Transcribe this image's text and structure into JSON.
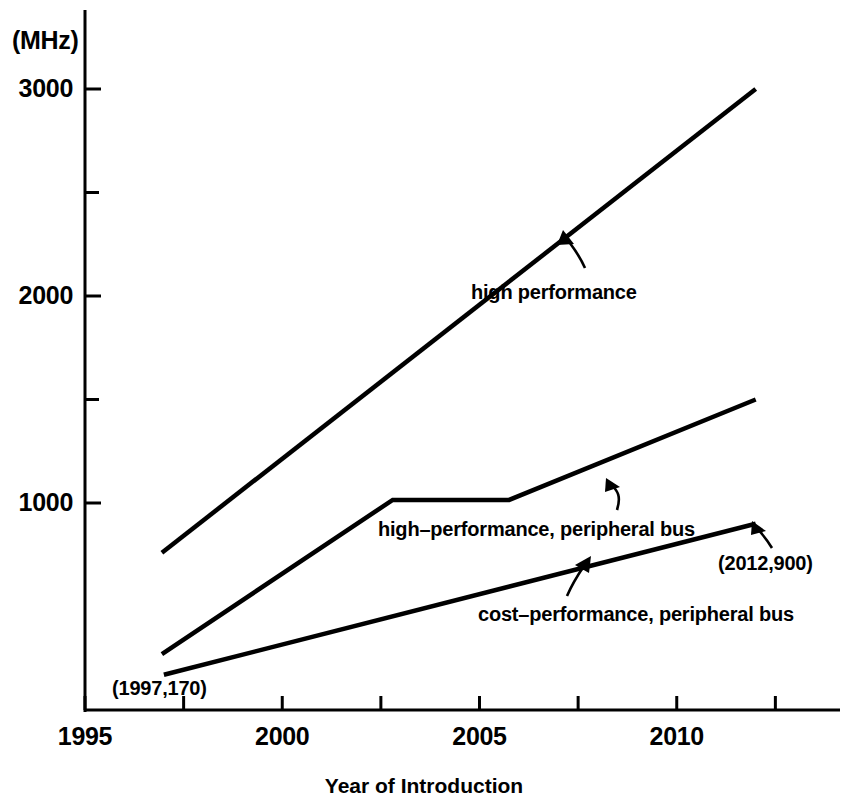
{
  "chart_data": {
    "type": "line",
    "title": "",
    "subtitle": "",
    "xlabel": "Year of Introduction",
    "ylabel": "",
    "yunit_label": "(MHz)",
    "xlim": [
      1995,
      2013.8
    ],
    "ylim": [
      0,
      3150
    ],
    "grid": false,
    "legend_position": "inline-annotations",
    "x_ticks_major": [
      {
        "value": 1995,
        "label": "1995"
      },
      {
        "value": 2000,
        "label": "2000"
      },
      {
        "value": 2005,
        "label": "2005"
      },
      {
        "value": 2010,
        "label": "2010"
      }
    ],
    "x_ticks_minor_interval": 2.5,
    "y_ticks_major": [
      {
        "value": 1000,
        "label": "1000"
      },
      {
        "value": 2000,
        "label": "2000"
      },
      {
        "value": 3000,
        "label": "3000"
      }
    ],
    "y_ticks_minor": [
      1500,
      2500
    ],
    "series": [
      {
        "name": "high performance",
        "label": "high performance",
        "color": "#000000",
        "points": [
          {
            "x": 1996.95,
            "y": 760
          },
          {
            "x": 2012.0,
            "y": 3000
          }
        ]
      },
      {
        "name": "high-performance, peripheral bus",
        "label": "high–performance, peripheral bus",
        "color": "#000000",
        "points": [
          {
            "x": 1996.95,
            "y": 270
          },
          {
            "x": 2002.8,
            "y": 1015
          },
          {
            "x": 2005.75,
            "y": 1015
          },
          {
            "x": 2012.0,
            "y": 1500
          }
        ]
      },
      {
        "name": "cost-performance, peripheral bus",
        "label": "cost–performance, peripheral bus",
        "color": "#000000",
        "points": [
          {
            "x": 1997.0,
            "y": 170
          },
          {
            "x": 2012.0,
            "y": 900
          }
        ]
      }
    ],
    "annotations": [
      {
        "name": "point-label-1997-170",
        "text": "(1997,170)",
        "x": 1997.0,
        "y": 170
      },
      {
        "name": "point-label-2012-900",
        "text": "(2012,900)",
        "x": 2012.0,
        "y": 900
      }
    ]
  },
  "axis": {
    "unit_label": "(MHz)",
    "x_title": "Year of Introduction"
  }
}
